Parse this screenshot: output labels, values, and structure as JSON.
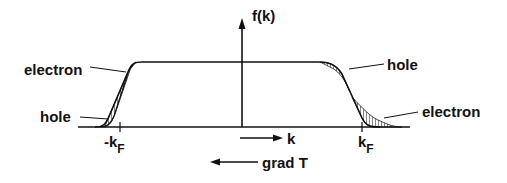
{
  "diagram": {
    "title": "",
    "axis": {
      "y_label": "f(k)",
      "x_label": "k",
      "neg_fermi_label": "-k",
      "pos_fermi_label": "k",
      "fermi_subscript": "F"
    },
    "gradient_label": "grad T",
    "annotations": {
      "left_upper": "electron",
      "left_lower": "hole",
      "right_upper": "hole",
      "right_lower": "electron"
    },
    "colors": {
      "ink": "#111111",
      "background": "#ffffff"
    }
  }
}
